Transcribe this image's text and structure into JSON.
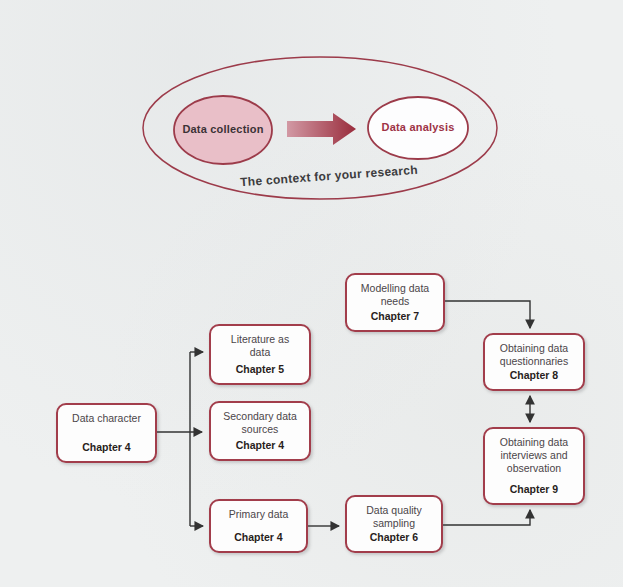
{
  "context_diagram": {
    "caption": "The context for your research",
    "left_ellipse": {
      "label": "Data collection",
      "fill": "#e9bfc8",
      "border": "#9c3b4a",
      "text_color": "#3b3236"
    },
    "right_ellipse": {
      "label": "Data analysis",
      "fill": "#fdfdfe",
      "border": "#9c3b4a",
      "text_color": "#9e3346"
    },
    "arrow": {
      "direction": "right",
      "gradient_from": "#d299a4",
      "gradient_to": "#992c3c"
    }
  },
  "flowchart": {
    "boxes": [
      {
        "id": "data-character",
        "title": "Data character",
        "chapter": "Chapter 4"
      },
      {
        "id": "literature-as-data",
        "title": "Literature as\ndata",
        "chapter": "Chapter 5"
      },
      {
        "id": "secondary-data-sources",
        "title": "Secondary data\nsources",
        "chapter": "Chapter 4"
      },
      {
        "id": "primary-data",
        "title": "Primary data",
        "chapter": "Chapter 4"
      },
      {
        "id": "modelling-data-needs",
        "title": "Modelling data\nneeds",
        "chapter": "Chapter 7"
      },
      {
        "id": "data-quality-sampling",
        "title": "Data quality\nsampling",
        "chapter": "Chapter 6"
      },
      {
        "id": "obtaining-data-questionnaries",
        "title": "Obtaining data\nquestionnaries",
        "chapter": "Chapter 8"
      },
      {
        "id": "obtaining-data-interviews",
        "title": "Obtaining data\ninterviews and\nobservation",
        "chapter": "Chapter 9"
      }
    ],
    "edges": [
      {
        "from": "data-character",
        "to": "literature-as-data",
        "type": "arrow"
      },
      {
        "from": "data-character",
        "to": "secondary-data-sources",
        "type": "arrow"
      },
      {
        "from": "data-character",
        "to": "primary-data",
        "type": "arrow"
      },
      {
        "from": "primary-data",
        "to": "data-quality-sampling",
        "type": "arrow"
      },
      {
        "from": "data-quality-sampling",
        "to": "obtaining-data-interviews",
        "type": "arrow"
      },
      {
        "from": "modelling-data-needs",
        "to": "obtaining-data-questionnaries",
        "type": "arrow"
      },
      {
        "from": "obtaining-data-questionnaries",
        "to": "obtaining-data-interviews",
        "type": "double-arrow"
      }
    ],
    "colors": {
      "box_border": "#a23d4b",
      "box_fill": "#fdfdfd",
      "title_text": "#4b4549",
      "chapter_text": "#281d20",
      "connector": "#333333"
    }
  }
}
